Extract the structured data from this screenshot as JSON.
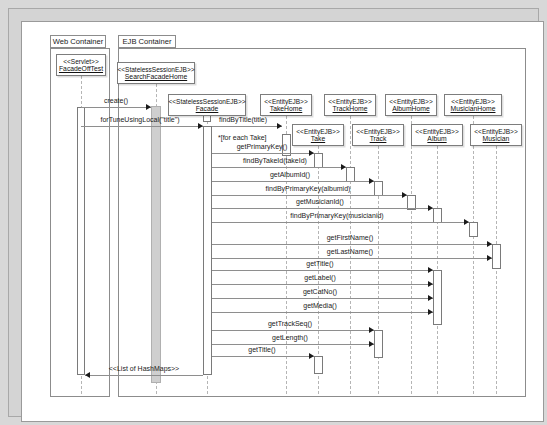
{
  "diagram": {
    "type": "uml-sequence-diagram",
    "title": "",
    "containers": [
      {
        "id": "web",
        "label": "Web Container",
        "x": 28,
        "y": 13,
        "w": 60,
        "h": 362,
        "tab_w": 56,
        "tab_h": 13
      },
      {
        "id": "ejb",
        "label": "EJB Container",
        "x": 96,
        "y": 13,
        "w": 408,
        "h": 362,
        "tab_w": 58,
        "tab_h": 13
      }
    ],
    "participants": [
      {
        "id": "servlet",
        "stereotype": "<<Servlet>>",
        "name": "FacadeOffTest",
        "x": 34,
        "y": 32,
        "w": 50,
        "h": 22,
        "lifeline_x": 59,
        "lifeline_top": 54,
        "lifeline_bottom": 372
      },
      {
        "id": "sfhome",
        "stereotype": "<<StatelessSessionEJB>>",
        "name": "SearchFacadeHome",
        "x": 95,
        "y": 40,
        "w": 78,
        "h": 22,
        "lifeline_x": 134,
        "lifeline_top": 62,
        "lifeline_bottom": 372
      },
      {
        "id": "facade",
        "stereotype": "<<StatelessSessionEJB>>",
        "name": "Facade",
        "x": 146,
        "y": 72,
        "w": 78,
        "h": 22,
        "lifeline_x": 185,
        "lifeline_top": 94,
        "lifeline_bottom": 372
      },
      {
        "id": "takehome",
        "stereotype": "<<EntityEJB>>",
        "name": "TakeHome",
        "x": 238,
        "y": 72,
        "w": 52,
        "h": 22,
        "lifeline_x": 264,
        "lifeline_top": 94,
        "lifeline_bottom": 372
      },
      {
        "id": "trackhome",
        "stereotype": "<<EntityEJB>>",
        "name": "TrackHome",
        "x": 302,
        "y": 72,
        "w": 52,
        "h": 22,
        "lifeline_x": 328,
        "lifeline_top": 94,
        "lifeline_bottom": 372
      },
      {
        "id": "albumhome",
        "stereotype": "<<EntityEJB>>",
        "name": "AlbumHome",
        "x": 363,
        "y": 72,
        "w": 52,
        "h": 22,
        "lifeline_x": 389,
        "lifeline_top": 94,
        "lifeline_bottom": 372
      },
      {
        "id": "musicianhome",
        "stereotype": "<<EntityEJB>>",
        "name": "MusicianHome",
        "x": 422,
        "y": 72,
        "w": 58,
        "h": 22,
        "lifeline_x": 451,
        "lifeline_top": 94,
        "lifeline_bottom": 372
      },
      {
        "id": "take",
        "stereotype": "<<EntityEJB>>",
        "name": "Take",
        "x": 270,
        "y": 102,
        "w": 52,
        "h": 22,
        "lifeline_x": 296,
        "lifeline_top": 124,
        "lifeline_bottom": 372
      },
      {
        "id": "track",
        "stereotype": "<<EntityEJB>>",
        "name": "Track",
        "x": 330,
        "y": 102,
        "w": 52,
        "h": 22,
        "lifeline_x": 356,
        "lifeline_top": 124,
        "lifeline_bottom": 372
      },
      {
        "id": "album",
        "stereotype": "<<EntityEJB>>",
        "name": "Album",
        "x": 389,
        "y": 102,
        "w": 52,
        "h": 22,
        "lifeline_x": 415,
        "lifeline_top": 124,
        "lifeline_bottom": 372
      },
      {
        "id": "musician",
        "stereotype": "<<EntityEJB>>",
        "name": "Musician",
        "x": 448,
        "y": 102,
        "w": 52,
        "h": 22,
        "lifeline_x": 474,
        "lifeline_top": 124,
        "lifeline_bottom": 372
      }
    ],
    "activations": [
      {
        "id": "a-servlet",
        "x": 55,
        "y": 85,
        "w": 8,
        "h": 268,
        "shaded": false
      },
      {
        "id": "a-sfhome",
        "x": 129,
        "y": 84,
        "w": 10,
        "h": 277,
        "shaded": true
      },
      {
        "id": "a-facade-h",
        "x": 181,
        "y": 84,
        "w": 8,
        "h": 16,
        "shaded": false
      },
      {
        "id": "a-facade",
        "x": 181,
        "y": 104,
        "w": 9,
        "h": 249,
        "shaded": false
      },
      {
        "id": "a-takehome",
        "x": 260,
        "y": 112,
        "w": 9,
        "h": 22,
        "shaded": false
      },
      {
        "id": "a-take1",
        "x": 292,
        "y": 131,
        "w": 9,
        "h": 15,
        "shaded": false
      },
      {
        "id": "a-trackh",
        "x": 324,
        "y": 145,
        "w": 9,
        "h": 15,
        "shaded": false
      },
      {
        "id": "a-track1",
        "x": 352,
        "y": 159,
        "w": 9,
        "h": 15,
        "shaded": false
      },
      {
        "id": "a-albumh",
        "x": 385,
        "y": 173,
        "w": 9,
        "h": 15,
        "shaded": false
      },
      {
        "id": "a-album1",
        "x": 411,
        "y": 186,
        "w": 9,
        "h": 15,
        "shaded": false
      },
      {
        "id": "a-mushome",
        "x": 447,
        "y": 200,
        "w": 9,
        "h": 15,
        "shaded": false
      },
      {
        "id": "a-musician",
        "x": 470,
        "y": 222,
        "w": 9,
        "h": 25,
        "shaded": false
      },
      {
        "id": "a-album2",
        "x": 411,
        "y": 248,
        "w": 9,
        "h": 55,
        "shaded": false
      },
      {
        "id": "a-track2",
        "x": 352,
        "y": 308,
        "w": 9,
        "h": 28,
        "shaded": false
      },
      {
        "id": "a-take2",
        "x": 292,
        "y": 334,
        "w": 9,
        "h": 18,
        "shaded": false
      }
    ],
    "messages": [
      {
        "id": "m1",
        "label": "create()",
        "from_x": 59,
        "to_x": 129,
        "y": 85,
        "label_x": 94,
        "dir": "right",
        "style": "solid"
      },
      {
        "id": "m2",
        "label": "forTuneUsingLocal(\"title\")",
        "from_x": 59,
        "to_x": 181,
        "y": 104,
        "label_x": 118,
        "dir": "right",
        "style": "solid"
      },
      {
        "id": "m3",
        "label": "findByTitle(title)",
        "from_x": 190,
        "to_x": 260,
        "y": 104,
        "label_x": 221,
        "dir": "right",
        "style": "solid"
      },
      {
        "id": "m4",
        "label": "getPrimaryKey()",
        "from_x": 190,
        "to_x": 292,
        "y": 131,
        "label_x": 240,
        "dir": "right",
        "style": "solid"
      },
      {
        "id": "m5",
        "label": "findByTakeId(takeId)",
        "from_x": 190,
        "to_x": 324,
        "y": 145,
        "label_x": 253,
        "dir": "right",
        "style": "solid"
      },
      {
        "id": "m6",
        "label": "getAlbumId()",
        "from_x": 190,
        "to_x": 352,
        "y": 159,
        "label_x": 268,
        "dir": "right",
        "style": "solid"
      },
      {
        "id": "m7",
        "label": "findByPrimaryKey(albumid)",
        "from_x": 190,
        "to_x": 385,
        "y": 173,
        "label_x": 286,
        "dir": "right",
        "style": "solid"
      },
      {
        "id": "m8",
        "label": "getMusicianId()",
        "from_x": 190,
        "to_x": 411,
        "y": 186,
        "label_x": 298,
        "dir": "right",
        "style": "solid"
      },
      {
        "id": "m9",
        "label": "findByPrimaryKey(musicianid)",
        "from_x": 190,
        "to_x": 447,
        "y": 200,
        "label_x": 315,
        "dir": "right",
        "style": "solid"
      },
      {
        "id": "m10",
        "label": "getFirstName()",
        "from_x": 190,
        "to_x": 470,
        "y": 222,
        "label_x": 328,
        "dir": "right",
        "style": "solid"
      },
      {
        "id": "m11",
        "label": "getLastName()",
        "from_x": 190,
        "to_x": 470,
        "y": 236,
        "label_x": 328,
        "dir": "right",
        "style": "solid"
      },
      {
        "id": "m12",
        "label": "getTitle()",
        "from_x": 190,
        "to_x": 411,
        "y": 248,
        "label_x": 298,
        "dir": "right",
        "style": "solid"
      },
      {
        "id": "m13",
        "label": "getLabel()",
        "from_x": 190,
        "to_x": 411,
        "y": 262,
        "label_x": 298,
        "dir": "right",
        "style": "solid"
      },
      {
        "id": "m14",
        "label": "getCatNo()",
        "from_x": 190,
        "to_x": 411,
        "y": 276,
        "label_x": 298,
        "dir": "right",
        "style": "solid"
      },
      {
        "id": "m15",
        "label": "getMedia()",
        "from_x": 190,
        "to_x": 411,
        "y": 290,
        "label_x": 298,
        "dir": "right",
        "style": "solid"
      },
      {
        "id": "m16",
        "label": "getTrackSeq()",
        "from_x": 190,
        "to_x": 352,
        "y": 308,
        "label_x": 268,
        "dir": "right",
        "style": "solid"
      },
      {
        "id": "m17",
        "label": "getLength()",
        "from_x": 190,
        "to_x": 352,
        "y": 322,
        "label_x": 268,
        "dir": "right",
        "style": "solid"
      },
      {
        "id": "m18",
        "label": "getTitle()",
        "from_x": 190,
        "to_x": 292,
        "y": 334,
        "label_x": 240,
        "dir": "right",
        "style": "solid"
      },
      {
        "id": "m19",
        "label": "<<List of HashMaps>>",
        "from_x": 181,
        "to_x": 63,
        "y": 353,
        "label_x": 122,
        "dir": "left",
        "style": "solid"
      }
    ],
    "guards": [
      {
        "id": "g1",
        "label": "*[for each Take]",
        "x": 196,
        "y": 112
      }
    ]
  }
}
